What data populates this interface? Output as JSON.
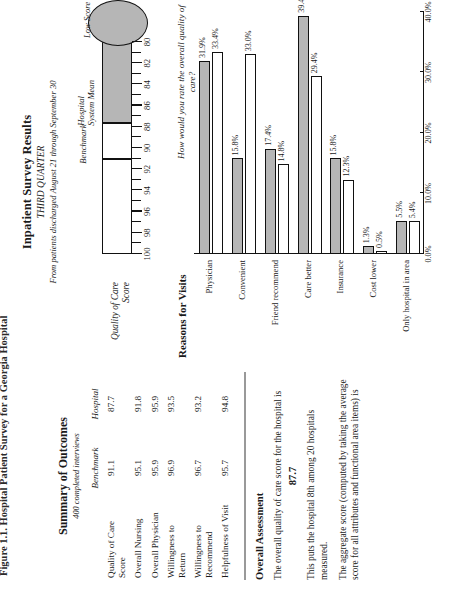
{
  "figure_caption": "Figure 1.1. Hospital Patient Survey for a Georgia Hospital",
  "survey": {
    "title": "Inpatient Survey Results",
    "subtitle": "THIRD QUARTER",
    "subtitle2": "From patients discharged August 21 through September 30",
    "gauge": {
      "axis_label": "Quality of Care Score",
      "scale_max": 100,
      "scale_min": 80,
      "tick_labels": [
        "100",
        "98",
        "96",
        "94",
        "92",
        "90",
        "88",
        "86",
        "84",
        "82",
        "80"
      ],
      "annotations": [
        {
          "name": "benchmark",
          "label": "Benchmark",
          "value": 91.1
        },
        {
          "name": "hospital-system-mean",
          "label": "Hospital\nSystem Mean",
          "value": 87.7
        },
        {
          "name": "low-score",
          "label": "Low Score",
          "value": 80.0
        }
      ],
      "benchmark_label": "Benchmark",
      "system_mean_label_line1": "Hospital",
      "system_mean_label_line2": "System Mean",
      "low_score_label": "Low Score",
      "question": "How would you rate the overall quality of care?"
    }
  },
  "summary": {
    "title": "Summary of Outcomes",
    "subtitle": "400 completed interviews",
    "columns": [
      "",
      "Benchmark",
      "Hospital"
    ],
    "rows": [
      {
        "label": "Quality of Care Score",
        "benchmark": "91.1",
        "hospital": "87.7"
      },
      {
        "label": "Overall Nursing",
        "benchmark": "95.1",
        "hospital": "91.8"
      },
      {
        "label": "Overall Physician",
        "benchmark": "95.9",
        "hospital": "95.9"
      },
      {
        "label": "Willingness to Return",
        "benchmark": "96.9",
        "hospital": "93.5"
      },
      {
        "label": "Willingness to Recommend",
        "benchmark": "96.7",
        "hospital": "93.2"
      },
      {
        "label": "Helpfulness of Visit",
        "benchmark": "95.7",
        "hospital": "94.8"
      }
    ]
  },
  "assessment": {
    "title": "Overall Assessment",
    "para1": "The overall quality of care score for the hospital is",
    "score": "87.7",
    "para2": "This puts the hospital 8th among 20 hospitals measured.",
    "para3": "The aggregate score (computed by taking the average score for all attributes and functional area items) is"
  },
  "chart_data": {
    "type": "bar",
    "orientation": "horizontal",
    "title": "Reasons for Visits",
    "xlabel": "",
    "ylabel": "",
    "xlim": [
      0,
      0.4
    ],
    "tick_labels": [
      "0.0%",
      "10.0%",
      "20.0%",
      "30.0%",
      "40.0%"
    ],
    "tick_values": [
      0,
      10,
      20,
      30,
      40
    ],
    "grid": false,
    "legend": [
      {
        "name": "hospital",
        "label": "Hospital",
        "color": "#b6b6b6"
      },
      {
        "name": "benchmark",
        "label": "Benchmark",
        "color": "#ffffff"
      }
    ],
    "categories": [
      "Physician",
      "Convenient",
      "Friend recommend",
      "Care better",
      "Insurance",
      "Cost lower",
      "Only hospital in area"
    ],
    "series": [
      {
        "name": "Hospital",
        "values": [
          31.9,
          15.8,
          17.4,
          39.4,
          15.8,
          1.3,
          5.5
        ],
        "labels": [
          "31.9%",
          "15.8%",
          "17.4%",
          "39.4%",
          "15.8%",
          "1.3%",
          "5.5%"
        ]
      },
      {
        "name": "Benchmark",
        "values": [
          33.4,
          33.0,
          14.8,
          29.4,
          12.3,
          0.5,
          5.4
        ],
        "labels": [
          "33.4%",
          "33.0%",
          "14.8%",
          "29.4%",
          "12.3%",
          "0.5%",
          "5.4%"
        ]
      }
    ]
  },
  "colors": {
    "hospital_fill": "#b6b6b6",
    "benchmark_fill": "#ffffff",
    "rule": "#999999",
    "ink": "#1a1a1a"
  }
}
